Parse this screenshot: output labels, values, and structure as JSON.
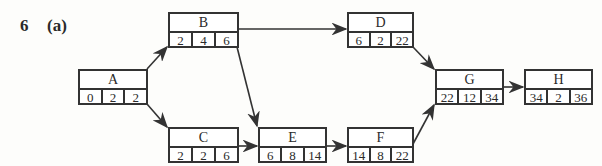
{
  "question": {
    "number": "6",
    "part": "(a)"
  },
  "nodes": {
    "A": {
      "label": "A",
      "est": "0",
      "dur": "2",
      "eft": "2"
    },
    "B": {
      "label": "B",
      "est": "2",
      "dur": "4",
      "eft": "6"
    },
    "C": {
      "label": "C",
      "est": "2",
      "dur": "2",
      "eft": "6"
    },
    "D": {
      "label": "D",
      "est": "6",
      "dur": "2",
      "eft": "22"
    },
    "E": {
      "label": "E",
      "est": "6",
      "dur": "8",
      "eft": "14"
    },
    "F": {
      "label": "F",
      "est": "14",
      "dur": "8",
      "eft": "22"
    },
    "G": {
      "label": "G",
      "est": "22",
      "dur": "12",
      "eft": "34"
    },
    "H": {
      "label": "H",
      "est": "34",
      "dur": "2",
      "eft": "36"
    }
  },
  "edges": [
    [
      "A",
      "B"
    ],
    [
      "A",
      "C"
    ],
    [
      "B",
      "D"
    ],
    [
      "B",
      "E"
    ],
    [
      "C",
      "E"
    ],
    [
      "E",
      "F"
    ],
    [
      "D",
      "G"
    ],
    [
      "F",
      "G"
    ],
    [
      "G",
      "H"
    ]
  ]
}
